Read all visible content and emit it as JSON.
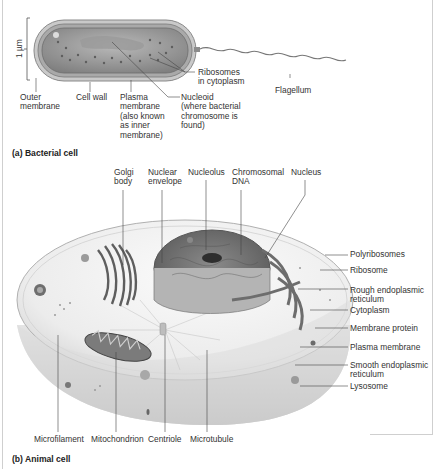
{
  "figure": {
    "panel_a": {
      "caption": "(a) Bacterial cell",
      "scale_bar": "1 µm",
      "labels": {
        "ribosomes": "Ribosomes\nin cytoplasm",
        "flagellum": "Flagellum",
        "outer_membrane": "Outer\nmembrane",
        "cell_wall": "Cell wall",
        "plasma_membrane": "Plasma\nmembrane\n(also known\nas inner\nmembrane)",
        "nucleoid": "Nucleoid\n(where bacterial\nchromosome is\nfound)"
      }
    },
    "panel_b": {
      "caption": "(b) Animal cell",
      "top_labels": {
        "golgi": "Golgi\nbody",
        "nuclear_envelope": "Nuclear\nenvelope",
        "nucleolus": "Nucleolus",
        "chromosomal_dna": "Chromosomal\nDNA",
        "nucleus": "Nucleus"
      },
      "right_labels": {
        "polyribosomes": "Polyribosomes",
        "ribosome": "Ribosome",
        "rough_er": "Rough endoplasmic\nreticulum",
        "cytoplasm": "Cytoplasm",
        "membrane_protein": "Membrane protein",
        "plasma_membrane": "Plasma membrane",
        "smooth_er": "Smooth endoplasmic\nreticulum",
        "lysosome": "Lysosome"
      },
      "bottom_labels": {
        "microfilament": "Microfilament",
        "mitochondrion": "Mitochondrion",
        "centriole": "Centriole",
        "microtubule": "Microtubule"
      }
    },
    "colors": {
      "bacterium_outer": "#a8a8a8",
      "bacterium_inner": "#8e8e8e",
      "cytoplasm": "#e6e6e6",
      "organelle_dark": "#6a6a6a",
      "leader_line": "#444444"
    }
  }
}
